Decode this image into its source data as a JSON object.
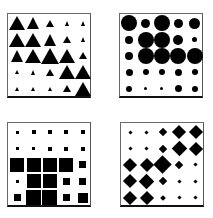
{
  "figure": {
    "panels": [
      {
        "id": "triangles",
        "shape": "triangle",
        "color": "#000000",
        "position": {
          "left": 7,
          "top": 13
        },
        "sizes": [
          [
            16,
            13,
            8,
            5,
            5
          ],
          [
            16,
            16,
            13,
            8,
            5
          ],
          [
            13,
            16,
            18,
            16,
            8
          ],
          [
            4,
            5,
            8,
            16,
            16
          ],
          [
            4,
            4,
            4,
            8,
            16
          ]
        ]
      },
      {
        "id": "circles",
        "shape": "circle",
        "color": "#000000",
        "position": {
          "left": 119,
          "top": 13
        },
        "sizes": [
          [
            16,
            9,
            16,
            9,
            11
          ],
          [
            8,
            16,
            16,
            10,
            5
          ],
          [
            8,
            16,
            16,
            16,
            16
          ],
          [
            7,
            6,
            6,
            7,
            6
          ],
          [
            6,
            3,
            3,
            7,
            6
          ]
        ]
      },
      {
        "id": "squares",
        "shape": "square",
        "color": "#000000",
        "position": {
          "left": 7,
          "top": 122
        },
        "sizes": [
          [
            3,
            4,
            4,
            4,
            4
          ],
          [
            3,
            3,
            4,
            4,
            4
          ],
          [
            14,
            14,
            14,
            14,
            7
          ],
          [
            3,
            14,
            14,
            7,
            7
          ],
          [
            7,
            15,
            15,
            7,
            10
          ]
        ]
      },
      {
        "id": "diamonds",
        "shape": "diamond",
        "color": "#000000",
        "position": {
          "left": 120,
          "top": 122
        },
        "sizes": [
          [
            4,
            4,
            9,
            14,
            14
          ],
          [
            4,
            4,
            9,
            16,
            14
          ],
          [
            14,
            14,
            18,
            9,
            4
          ],
          [
            14,
            16,
            9,
            4,
            4
          ],
          [
            14,
            14,
            5,
            4,
            4
          ]
        ]
      }
    ]
  }
}
